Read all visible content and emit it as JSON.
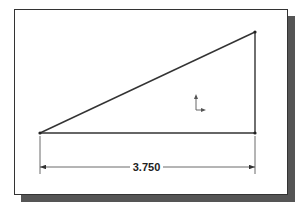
{
  "sketch": {
    "dimension": {
      "label": "3.750",
      "value": 3.75
    },
    "vertices": {
      "left": [
        40,
        133
      ],
      "top_right": [
        255,
        32
      ],
      "bottom_right": [
        255,
        133
      ]
    },
    "colors": {
      "line": "#333333",
      "shadow": "#555555",
      "background": "#ffffff"
    }
  }
}
